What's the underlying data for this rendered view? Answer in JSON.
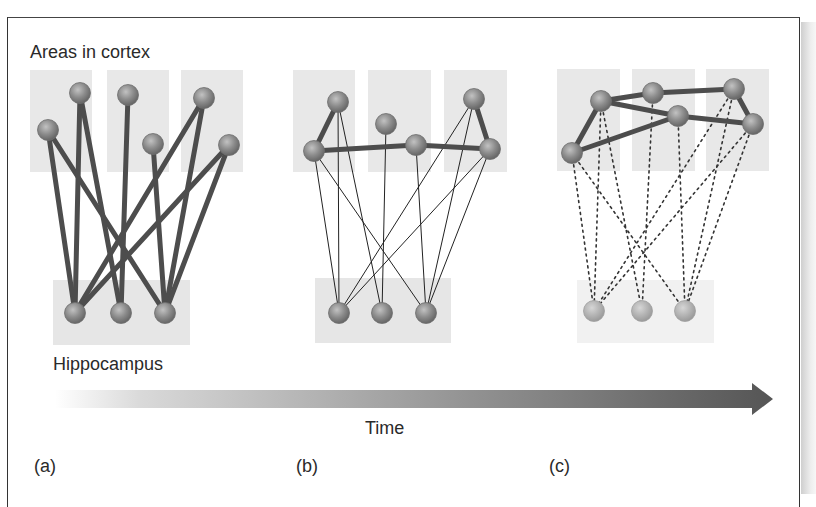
{
  "labels": {
    "cortex": "Areas in cortex",
    "hippocampus": "Hippocampus",
    "time": "Time",
    "panel_a": "(a)",
    "panel_b": "(b)",
    "panel_c": "(c)"
  },
  "colors": {
    "region_box": "#e6e6e6",
    "node_fill": "#8a8a8a",
    "node_highlight": "#b8b8b8",
    "strong_edge": "#4a4a4a",
    "thin_edge": "#222222",
    "faded_node": "#b0b0b0",
    "arrow_dark": "#5a5a5a"
  },
  "panels": [
    {
      "id": "a",
      "description": "Strong hippocampus-cortex connections; no cortico-cortical links",
      "cortex_boxes": [
        [
          30,
          70,
          62,
          102
        ],
        [
          107,
          70,
          62,
          102
        ],
        [
          181,
          70,
          62,
          102
        ]
      ],
      "hippo_box": [
        53,
        280,
        137,
        65
      ],
      "cortex_nodes": [
        [
          48,
          130
        ],
        [
          80,
          93
        ],
        [
          128,
          95
        ],
        [
          153,
          144
        ],
        [
          204,
          98
        ],
        [
          229,
          145
        ]
      ],
      "hippo_nodes": [
        [
          75,
          313
        ],
        [
          121,
          313
        ],
        [
          165,
          313
        ]
      ],
      "hippo_edges_style": "thick",
      "hippo_edges": [
        [
          0,
          0
        ],
        [
          0,
          2
        ],
        [
          1,
          0
        ],
        [
          1,
          1
        ],
        [
          2,
          1
        ],
        [
          3,
          2
        ],
        [
          4,
          0
        ],
        [
          4,
          2
        ],
        [
          5,
          0
        ],
        [
          5,
          2
        ]
      ],
      "cortical_edges": []
    },
    {
      "id": "b",
      "description": "Weakening hippocampal links; cortico-cortical links forming",
      "cortex_boxes": [
        [
          293,
          70,
          62,
          102
        ],
        [
          368,
          70,
          63,
          102
        ],
        [
          444,
          70,
          63,
          102
        ]
      ],
      "hippo_box": [
        315,
        278,
        136,
        65
      ],
      "cortex_nodes": [
        [
          314,
          151
        ],
        [
          338,
          102
        ],
        [
          386,
          124
        ],
        [
          416,
          145
        ],
        [
          474,
          99
        ],
        [
          490,
          149
        ]
      ],
      "hippo_nodes": [
        [
          339,
          313
        ],
        [
          382,
          313
        ],
        [
          426,
          313
        ]
      ],
      "hippo_edges_style": "thin",
      "hippo_edges": [
        [
          0,
          0
        ],
        [
          0,
          2
        ],
        [
          1,
          0
        ],
        [
          1,
          1
        ],
        [
          2,
          1
        ],
        [
          3,
          2
        ],
        [
          4,
          0
        ],
        [
          4,
          2
        ],
        [
          5,
          0
        ],
        [
          5,
          2
        ]
      ],
      "cortical_edges": [
        [
          0,
          1
        ],
        [
          0,
          3
        ],
        [
          3,
          5
        ],
        [
          4,
          5
        ]
      ]
    },
    {
      "id": "c",
      "description": "Cortico-cortical network consolidated; hippocampal links dotted/faded",
      "cortex_boxes": [
        [
          557,
          69,
          63,
          102
        ],
        [
          632,
          69,
          63,
          102
        ],
        [
          706,
          69,
          63,
          102
        ]
      ],
      "hippo_box": [
        577,
        280,
        137,
        63
      ],
      "cortex_nodes": [
        [
          572,
          153
        ],
        [
          601,
          101
        ],
        [
          653,
          93
        ],
        [
          678,
          116
        ],
        [
          734,
          89
        ],
        [
          753,
          124
        ]
      ],
      "hippo_nodes": [
        [
          594,
          311
        ],
        [
          642,
          311
        ],
        [
          685,
          311
        ]
      ],
      "hippo_edges_style": "dotted",
      "hippo_edges": [
        [
          0,
          0
        ],
        [
          0,
          2
        ],
        [
          1,
          0
        ],
        [
          1,
          1
        ],
        [
          2,
          1
        ],
        [
          3,
          2
        ],
        [
          4,
          0
        ],
        [
          4,
          2
        ],
        [
          5,
          0
        ],
        [
          5,
          2
        ]
      ],
      "cortical_edges": [
        [
          0,
          1
        ],
        [
          1,
          2
        ],
        [
          2,
          4
        ],
        [
          4,
          5
        ],
        [
          5,
          3
        ],
        [
          3,
          1
        ],
        [
          3,
          0
        ]
      ]
    }
  ],
  "time_arrow": {
    "x_start": 55,
    "x_end": 773,
    "y_center": 399,
    "shaft_height": 18,
    "head_length": 21,
    "head_height": 32
  }
}
